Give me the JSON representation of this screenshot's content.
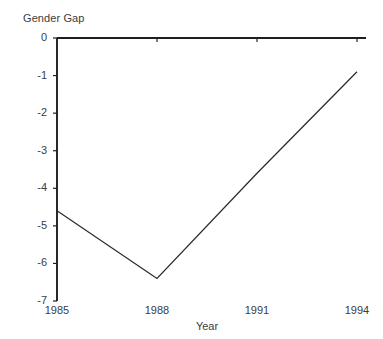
{
  "chart_data": {
    "type": "line",
    "title": "Gender Gap",
    "xlabel": "Year",
    "ylabel": "",
    "x": [
      1985,
      1988,
      1991,
      1994
    ],
    "series": [
      {
        "name": "Gender Gap",
        "values": [
          -4.6,
          -6.4,
          -3.6,
          -0.9
        ]
      }
    ],
    "xlim": [
      1985,
      1994
    ],
    "ylim": [
      -7,
      0
    ],
    "xticks": [
      1985,
      1988,
      1991,
      1994
    ],
    "xtick_labels": [
      "1985",
      "1988",
      "1991",
      "1994"
    ],
    "yticks": [
      0,
      -1,
      -2,
      -3,
      -4,
      -5,
      -6,
      -7
    ],
    "ytick_labels": [
      "0",
      "-1",
      "-2",
      "-3",
      "-4",
      "-5",
      "-6",
      "-7"
    ],
    "grid": false,
    "legend": null,
    "line_color": "#2b2b2b",
    "axis_color": "#1e1e1e",
    "background": "#ffffff"
  }
}
